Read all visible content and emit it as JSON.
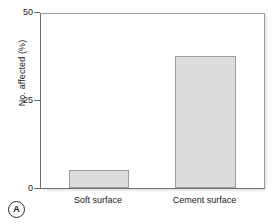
{
  "panel": {
    "letter": "A"
  },
  "chart_data": {
    "type": "bar",
    "title": "",
    "xlabel": "",
    "ylabel": "No. affected (%)",
    "categories": [
      "Soft surface",
      "Cement surface"
    ],
    "values": [
      5,
      37.5
    ],
    "ylim": [
      0,
      50
    ],
    "yticks": [
      0,
      25,
      50
    ],
    "ytick_labels": [
      "0",
      "25",
      "50"
    ],
    "grid": false,
    "legend": null,
    "bar_fill_color": "#dcdcdc",
    "bar_edge_color": "#9d9d9d",
    "axis_color": "#6e6e6e"
  }
}
